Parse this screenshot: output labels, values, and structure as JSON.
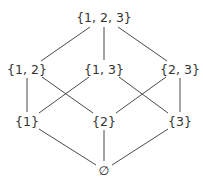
{
  "diagram": {
    "type": "hasse-diagram",
    "title": "",
    "nodes": [
      {
        "id": "n123",
        "label": "{1, 2, 3}",
        "x": 104,
        "y": 17
      },
      {
        "id": "n12",
        "label": "{1, 2}",
        "x": 27,
        "y": 69
      },
      {
        "id": "n13",
        "label": "{1, 3}",
        "x": 104,
        "y": 69
      },
      {
        "id": "n23",
        "label": "{2, 3}",
        "x": 180,
        "y": 69
      },
      {
        "id": "n1",
        "label": "{1}",
        "x": 27,
        "y": 121
      },
      {
        "id": "n2",
        "label": "{2}",
        "x": 104,
        "y": 121
      },
      {
        "id": "n3",
        "label": "{3}",
        "x": 180,
        "y": 121
      },
      {
        "id": "n0",
        "label": "∅",
        "x": 104,
        "y": 170
      }
    ],
    "edges": [
      {
        "from": "n123",
        "to": "n12",
        "x1": 90,
        "y1": 27,
        "x2": 41,
        "y2": 61
      },
      {
        "from": "n123",
        "to": "n13",
        "x1": 104,
        "y1": 27,
        "x2": 104,
        "y2": 60
      },
      {
        "from": "n123",
        "to": "n23",
        "x1": 118,
        "y1": 27,
        "x2": 167,
        "y2": 61
      },
      {
        "from": "n12",
        "to": "n1",
        "x1": 27,
        "y1": 78,
        "x2": 27,
        "y2": 112
      },
      {
        "from": "n12",
        "to": "n2",
        "x1": 42,
        "y1": 77,
        "x2": 93,
        "y2": 113
      },
      {
        "from": "n13",
        "to": "n1",
        "x1": 89,
        "y1": 77,
        "x2": 39,
        "y2": 113
      },
      {
        "from": "n13",
        "to": "n3",
        "x1": 119,
        "y1": 77,
        "x2": 168,
        "y2": 113
      },
      {
        "from": "n23",
        "to": "n2",
        "x1": 166,
        "y1": 77,
        "x2": 116,
        "y2": 113
      },
      {
        "from": "n23",
        "to": "n3",
        "x1": 180,
        "y1": 78,
        "x2": 180,
        "y2": 112
      },
      {
        "from": "n1",
        "to": "n0",
        "x1": 39,
        "y1": 129,
        "x2": 96,
        "y2": 165
      },
      {
        "from": "n2",
        "to": "n0",
        "x1": 104,
        "y1": 130,
        "x2": 104,
        "y2": 161
      },
      {
        "from": "n3",
        "to": "n0",
        "x1": 168,
        "y1": 129,
        "x2": 112,
        "y2": 165
      }
    ],
    "colors": {
      "edge": "#4a4a4a",
      "label": "#333333",
      "background": "#ffffff"
    }
  }
}
